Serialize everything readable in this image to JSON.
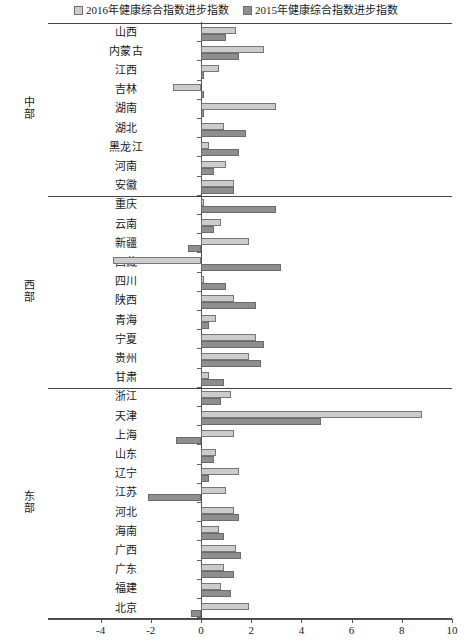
{
  "legend": {
    "entries": [
      {
        "label": "2016年健康综合指数进步指数",
        "color": "#cccccc",
        "key": "v2016"
      },
      {
        "label": "2015年健康综合指数进步指数",
        "color": "#8e8e8e",
        "key": "v2015"
      }
    ]
  },
  "axis": {
    "xlabel": "",
    "ticks": [
      "-4",
      "-2",
      "0",
      "2",
      "4",
      "6",
      "8",
      "10"
    ],
    "tick_values": [
      -4,
      -2,
      0,
      2,
      4,
      6,
      8,
      10
    ],
    "xmin": -4,
    "xmax": 10
  },
  "regions": [
    {
      "name": "中部",
      "chars": [
        "中",
        "部"
      ],
      "count": 9
    },
    {
      "name": "西部",
      "chars": [
        "西",
        "部"
      ],
      "count": 10
    },
    {
      "name": "东部",
      "chars": [
        "东",
        "部"
      ],
      "count": 12
    }
  ],
  "chart_data": {
    "type": "bar",
    "orientation": "horizontal",
    "title": "",
    "xlabel": "",
    "ylabel": "",
    "xlim": [
      -4,
      10
    ],
    "grid": false,
    "legend_position": "top-center",
    "categories": [
      "山西",
      "内蒙古",
      "江西",
      "吉林",
      "湖南",
      "湖北",
      "黑龙江",
      "河南",
      "安徽",
      "重庆",
      "云南",
      "新疆",
      "西藏",
      "四川",
      "陕西",
      "青海",
      "宁夏",
      "贵州",
      "甘肃",
      "浙江",
      "天津",
      "上海",
      "山东",
      "辽宁",
      "江苏",
      "河北",
      "海南",
      "广西",
      "广东",
      "福建",
      "北京"
    ],
    "groups": [
      {
        "name": "中部",
        "categories": [
          "山西",
          "内蒙古",
          "江西",
          "吉林",
          "湖南",
          "湖北",
          "黑龙江",
          "河南",
          "安徽"
        ]
      },
      {
        "name": "西部",
        "categories": [
          "重庆",
          "云南",
          "新疆",
          "西藏",
          "四川",
          "陕西",
          "青海",
          "宁夏",
          "贵州",
          "甘肃"
        ]
      },
      {
        "name": "东部",
        "categories": [
          "浙江",
          "天津",
          "上海",
          "山东",
          "辽宁",
          "江苏",
          "河北",
          "海南",
          "广西",
          "广东",
          "福建",
          "北京"
        ]
      }
    ],
    "series": [
      {
        "name": "2016年健康综合指数进步指数",
        "color": "#cccccc",
        "values": [
          1.4,
          2.5,
          0.7,
          -1.1,
          3.0,
          0.9,
          0.3,
          1.0,
          1.3,
          0.1,
          0.8,
          1.9,
          -3.5,
          0.1,
          1.3,
          0.6,
          2.2,
          1.9,
          0.3,
          1.2,
          8.8,
          1.3,
          0.6,
          1.5,
          1.0,
          1.3,
          0.7,
          1.4,
          0.9,
          0.8,
          1.9
        ]
      },
      {
        "name": "2015年健康综合指数进步指数",
        "color": "#8e8e8e",
        "values": [
          1.0,
          1.5,
          0.1,
          0.1,
          0.1,
          1.8,
          1.5,
          0.5,
          1.3,
          3.0,
          0.5,
          -0.5,
          3.2,
          1.0,
          2.2,
          0.3,
          2.5,
          2.4,
          0.9,
          0.8,
          4.8,
          -1.0,
          0.5,
          0.3,
          -2.1,
          1.5,
          0.9,
          1.6,
          1.3,
          1.2,
          -0.4
        ]
      }
    ]
  }
}
